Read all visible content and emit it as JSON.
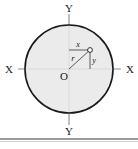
{
  "figure": {
    "kind": "circle-coordinate-diagram",
    "background_color": "#ffffff",
    "stroke_color": "#1a1a1a",
    "circle_fill_color": "#e8e8e8",
    "axis_color": "#8a8a8a",
    "labels": {
      "y_top": "Y",
      "y_bottom": "Y",
      "x_left": "X",
      "x_right": "X",
      "origin": "O",
      "x_component": "x",
      "y_component": "y",
      "radius": "r"
    },
    "geometry": {
      "center_x": 69,
      "center_y": 69,
      "radius_px": 44,
      "point_x": 90,
      "point_y": 50,
      "point_marker": "open-circle"
    }
  },
  "caption": {
    "divider_color": "#9a9a9a",
    "cut_text": "",
    "visible": true
  }
}
